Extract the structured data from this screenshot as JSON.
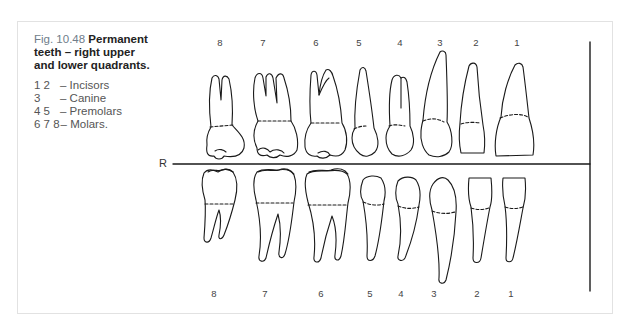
{
  "figure": {
    "label": "Fig. 10.48",
    "title": "Permanent teeth – right upper and lower quadrants.",
    "title_lines": [
      "Permanent",
      "teeth – right upper",
      "and lower quadrants."
    ]
  },
  "legend": [
    {
      "numbers": "1 2",
      "text": "– Incisors"
    },
    {
      "numbers": "3",
      "text": "– Canine"
    },
    {
      "numbers": "4 5",
      "text": "– Premolars"
    },
    {
      "numbers": "6 7 8",
      "text": "– Molars."
    }
  ],
  "side_label": "R",
  "upper_numbers": [
    {
      "n": "8",
      "x": 220
    },
    {
      "n": "7",
      "x": 263
    },
    {
      "n": "6",
      "x": 316
    },
    {
      "n": "5",
      "x": 359
    },
    {
      "n": "4",
      "x": 400
    },
    {
      "n": "3",
      "x": 440
    },
    {
      "n": "2",
      "x": 476
    },
    {
      "n": "1",
      "x": 517
    }
  ],
  "lower_numbers": [
    {
      "n": "8",
      "x": 214
    },
    {
      "n": "7",
      "x": 265
    },
    {
      "n": "6",
      "x": 321
    },
    {
      "n": "5",
      "x": 370
    },
    {
      "n": "4",
      "x": 401
    },
    {
      "n": "3",
      "x": 434
    },
    {
      "n": "2",
      "x": 477
    },
    {
      "n": "1",
      "x": 511
    }
  ],
  "colors": {
    "line": "#1a1a1a",
    "frame": "#e2e2e2",
    "fig_label": "#6f7d8a"
  }
}
